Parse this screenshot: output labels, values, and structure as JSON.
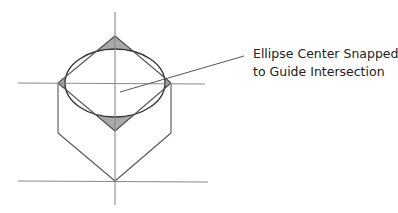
{
  "diagram": {
    "callout": {
      "lines": [
        "Ellipse Center Snapped",
        "to Guide Intersection"
      ]
    },
    "elements": {
      "guides": [
        "vertical-guide",
        "upper-horizontal-guide",
        "lower-horizontal-guide"
      ],
      "shape": "isometric cube top face with inscribed ellipse",
      "shaded_corners": 4
    },
    "colors": {
      "guide": "#8a8a8a",
      "edge": "#555555",
      "ellipse": "#333333",
      "corner_fill": "#a9a9a9",
      "text": "#222222"
    }
  }
}
